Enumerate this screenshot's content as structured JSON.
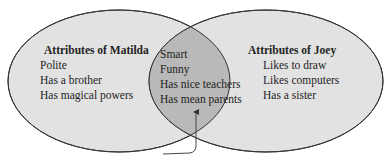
{
  "diagram": {
    "type": "venn",
    "colors": {
      "left_fill": "#e2e2e2",
      "right_fill": "#e2e2e2",
      "overlap_fill": "#b9b9b9",
      "stroke": "#333333",
      "background": "#ffffff"
    },
    "left": {
      "title": "Attributes of Matilda",
      "items": [
        "Polite",
        "Has a brother",
        "Has magical powers"
      ]
    },
    "right": {
      "title": "Attributes of Joey",
      "items": [
        "Likes to draw",
        "Likes computers",
        "Has a sister"
      ]
    },
    "overlap": {
      "items": [
        "Smart",
        "Funny",
        "Has nice teachers",
        "Has mean parents"
      ]
    },
    "arrow": {
      "points_to": "overlap"
    }
  }
}
